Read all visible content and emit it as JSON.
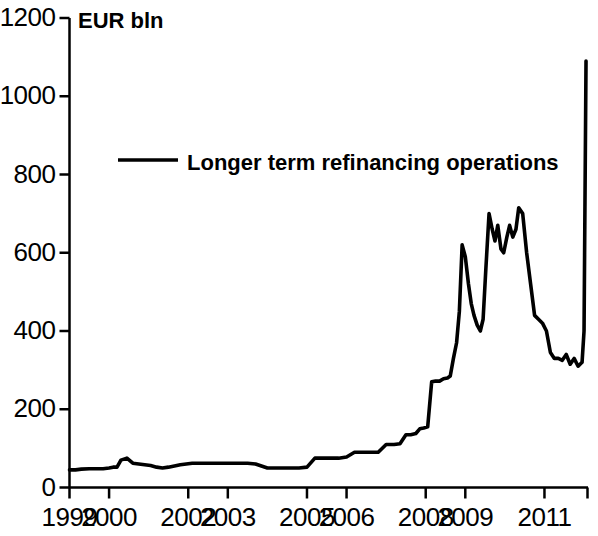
{
  "chart_data": {
    "type": "line",
    "title": "",
    "unit_label": "EUR bln",
    "xlabel": "",
    "ylabel": "EUR bln",
    "ylim": [
      0,
      1200
    ],
    "yticks": [
      0,
      200,
      400,
      600,
      800,
      1000,
      1200
    ],
    "ytick_labels": [
      "0",
      "200",
      "400",
      "600",
      "800",
      "1000",
      "1200"
    ],
    "xlim": [
      1999.0,
      2012.1
    ],
    "xticks": [
      1999,
      2000,
      2002,
      2003,
      2005,
      2006,
      2008,
      2009,
      2011
    ],
    "xtick_labels": [
      "1999",
      "2000",
      "2002",
      "2003",
      "2005",
      "2006",
      "2008",
      "2009",
      "2011"
    ],
    "grid": false,
    "legend": {
      "position": "upper-left-inset",
      "entries": [
        {
          "name": "Longer term refinancing operations",
          "color": "#000000",
          "line_width": 3
        }
      ]
    },
    "series": [
      {
        "name": "Longer term refinancing operations",
        "color": "#000000",
        "x": [
          1999.0,
          1999.15,
          1999.3,
          1999.5,
          1999.7,
          1999.85,
          2000.0,
          2000.1,
          2000.2,
          2000.3,
          2000.45,
          2000.6,
          2000.75,
          2000.9,
          2001.05,
          2001.2,
          2001.35,
          2001.5,
          2001.65,
          2001.8,
          2001.95,
          2002.1,
          2002.3,
          2002.5,
          2002.7,
          2002.9,
          2003.1,
          2003.3,
          2003.5,
          2003.7,
          2003.85,
          2004.0,
          2004.2,
          2004.4,
          2004.6,
          2004.8,
          2005.0,
          2005.2,
          2005.4,
          2005.6,
          2005.8,
          2006.0,
          2006.2,
          2006.4,
          2006.6,
          2006.8,
          2007.0,
          2007.2,
          2007.35,
          2007.5,
          2007.62,
          2007.75,
          2007.85,
          2007.95,
          2008.05,
          2008.15,
          2008.25,
          2008.35,
          2008.45,
          2008.55,
          2008.62,
          2008.7,
          2008.78,
          2008.85,
          2008.92,
          2009.0,
          2009.08,
          2009.15,
          2009.22,
          2009.3,
          2009.38,
          2009.45,
          2009.52,
          2009.6,
          2009.68,
          2009.75,
          2009.82,
          2009.9,
          2009.97,
          2010.05,
          2010.12,
          2010.2,
          2010.28,
          2010.35,
          2010.45,
          2010.55,
          2010.65,
          2010.75,
          2010.85,
          2010.95,
          2011.05,
          2011.15,
          2011.25,
          2011.35,
          2011.45,
          2011.55,
          2011.65,
          2011.75,
          2011.85,
          2011.95,
          2012.0,
          2012.05
        ],
        "y": [
          45,
          45,
          47,
          48,
          48,
          48,
          50,
          52,
          52,
          70,
          75,
          62,
          60,
          58,
          56,
          52,
          50,
          52,
          55,
          58,
          60,
          62,
          62,
          62,
          62,
          62,
          62,
          62,
          62,
          60,
          55,
          50,
          50,
          50,
          50,
          50,
          52,
          75,
          75,
          75,
          75,
          78,
          90,
          90,
          90,
          90,
          110,
          110,
          112,
          135,
          135,
          138,
          150,
          152,
          155,
          270,
          272,
          272,
          278,
          280,
          285,
          330,
          370,
          450,
          620,
          590,
          520,
          470,
          440,
          415,
          400,
          430,
          560,
          700,
          660,
          630,
          670,
          610,
          600,
          640,
          670,
          640,
          660,
          715,
          700,
          600,
          520,
          440,
          430,
          420,
          400,
          345,
          330,
          330,
          325,
          340,
          315,
          330,
          310,
          320,
          400,
          1090
        ]
      }
    ]
  }
}
